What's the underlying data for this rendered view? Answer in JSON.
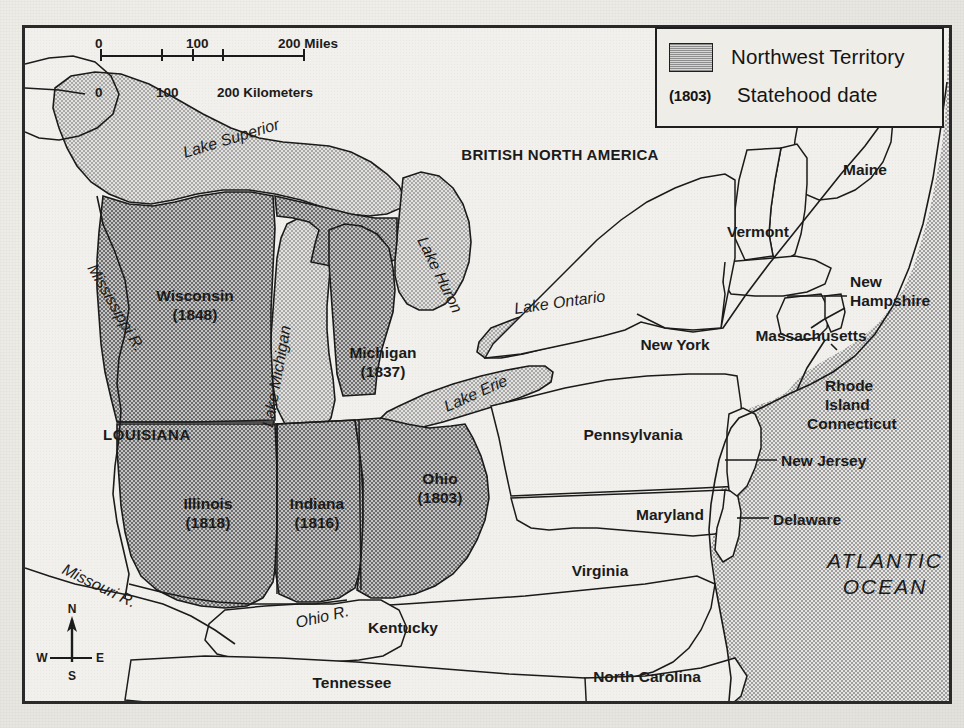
{
  "map": {
    "title": "Northwest Territory",
    "colors": {
      "territory_fill": "#9a9a9a",
      "land_fill": "#f1f0ec",
      "water_fill": "#c9c9c9",
      "ocean_fill": "#c6c6c6",
      "outline": "#1b1b1b",
      "frame": "#2a2a2a",
      "paper": "#e9e8e3"
    }
  },
  "legend": {
    "swatch_label": "Northwest Territory",
    "date_key": "(1803)",
    "date_label": "Statehood date"
  },
  "scale": {
    "miles": {
      "ticks": [
        "0",
        "100",
        "200 Miles"
      ]
    },
    "kilometers": {
      "ticks": [
        "0",
        "100",
        "200 Kilometers"
      ]
    }
  },
  "compass": {
    "n": "N",
    "s": "S",
    "e": "E",
    "w": "W"
  },
  "territory_states": [
    {
      "name": "Wisconsin",
      "date": "(1848)"
    },
    {
      "name": "Michigan",
      "date": "(1837)"
    },
    {
      "name": "Illinois",
      "date": "(1818)"
    },
    {
      "name": "Indiana",
      "date": "(1816)"
    },
    {
      "name": "Ohio",
      "date": "(1803)"
    }
  ],
  "labels": {
    "british_north_america": "BRITISH NORTH AMERICA",
    "louisiana": "LOUISIANA",
    "maine": "Maine",
    "vermont": "Vermont",
    "new_hampshire": "New\nHampshire",
    "new_hampshire_l1": "New",
    "new_hampshire_l2": "Hampshire",
    "massachusetts": "Massachusetts",
    "rhode_island_l1": "Rhode",
    "rhode_island_l2": "Island",
    "connecticut": "Connecticut",
    "new_york": "New York",
    "pennsylvania": "Pennsylvania",
    "new_jersey": "New Jersey",
    "maryland": "Maryland",
    "delaware": "Delaware",
    "virginia": "Virginia",
    "kentucky": "Kentucky",
    "tennessee": "Tennessee",
    "north_carolina": "North Carolina"
  },
  "water_labels": {
    "lake_superior": "Lake Superior",
    "lake_michigan": "Lake Michigan",
    "lake_huron": "Lake Huron",
    "lake_ontario": "Lake Ontario",
    "lake_erie": "Lake Erie",
    "atlantic_l1": "ATLANTIC",
    "atlantic_l2": "OCEAN"
  },
  "rivers": {
    "mississippi": "Mississippi R.",
    "missouri": "Missouri R.",
    "ohio": "Ohio R."
  }
}
